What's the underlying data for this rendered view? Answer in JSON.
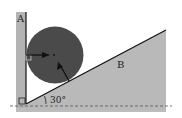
{
  "diagram": {
    "wall_label": "A",
    "incline_label": "B",
    "angle_label": "30°",
    "angle_degrees": 30,
    "colors": {
      "wall": "#b4b4b4",
      "incline": "#b9b9b9",
      "ball": "#4a4a4a",
      "line": "#111111"
    }
  }
}
